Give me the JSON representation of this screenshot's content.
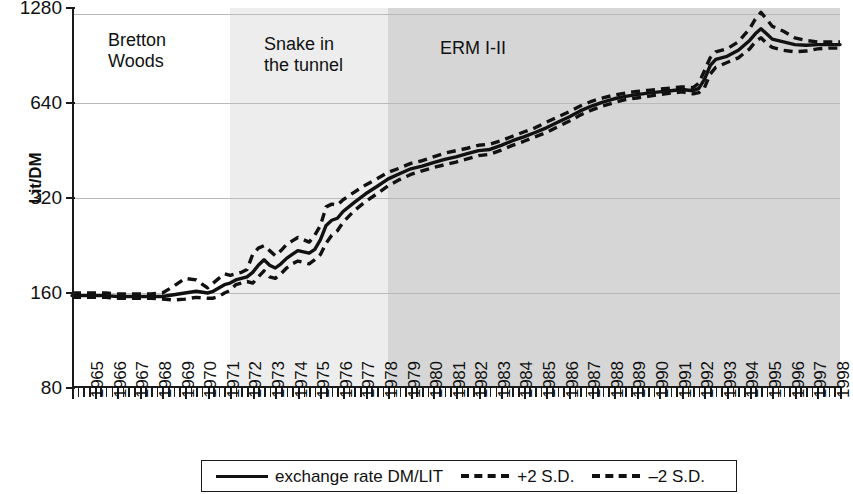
{
  "chart_data": {
    "type": "line",
    "title": "",
    "xlabel": "",
    "ylabel": "Lit/DM",
    "y_scale": "log2",
    "ylim": [
      80,
      1280
    ],
    "ytick_labels": [
      "1280",
      "640",
      "320",
      "160",
      "80"
    ],
    "ytick_values": [
      1280,
      640,
      320,
      160,
      80
    ],
    "xlim": [
      1965,
      1999
    ],
    "grid": true,
    "legend_position": "bottom",
    "categories": [
      "1965",
      "1966",
      "1967",
      "1968",
      "1969",
      "1970",
      "1971",
      "1972",
      "1973",
      "1974",
      "1975",
      "1976",
      "1977",
      "1978",
      "1979",
      "1980",
      "1981",
      "1982",
      "1983",
      "1984",
      "1985",
      "1986",
      "1987",
      "1988",
      "1989",
      "1990",
      "1991",
      "1992",
      "1993",
      "1994",
      "1995",
      "1996",
      "1997",
      "1998"
    ],
    "regions": [
      {
        "label": "Bretton\nWoods",
        "label_line1": "Bretton",
        "label_line2": "Woods",
        "start": 1965,
        "end": 1972.0,
        "color": "#ffffff"
      },
      {
        "label": "Snake in\nthe tunnel",
        "label_line1": "Snake in",
        "label_line2": "the tunnel",
        "start": 1972.0,
        "end": 1979.0,
        "color": "#ededed"
      },
      {
        "label": "ERM I-II",
        "label_line1": "ERM I-II",
        "label_line2": "",
        "start": 1979.0,
        "end": 1999.0,
        "color": "#d6d6d6"
      }
    ],
    "series": [
      {
        "name": "exchange rate DM/LIT",
        "style": "solid",
        "color": "#111111",
        "x": [
          1965.0,
          1965.5,
          1966.0,
          1966.5,
          1967.0,
          1967.5,
          1968.0,
          1968.5,
          1969.0,
          1969.5,
          1970.0,
          1970.5,
          1971.0,
          1971.25,
          1971.5,
          1971.75,
          1972.0,
          1972.25,
          1972.5,
          1972.75,
          1973.0,
          1973.25,
          1973.5,
          1973.75,
          1974.0,
          1974.25,
          1974.5,
          1974.75,
          1975.0,
          1975.25,
          1975.5,
          1975.75,
          1976.0,
          1976.25,
          1976.5,
          1976.75,
          1977.0,
          1977.5,
          1978.0,
          1978.5,
          1979.0,
          1979.5,
          1980.0,
          1980.5,
          1981.0,
          1981.5,
          1982.0,
          1982.5,
          1983.0,
          1983.5,
          1984.0,
          1984.5,
          1985.0,
          1985.5,
          1986.0,
          1986.5,
          1987.0,
          1987.5,
          1988.0,
          1988.5,
          1989.0,
          1989.5,
          1990.0,
          1990.5,
          1991.0,
          1991.5,
          1992.0,
          1992.5,
          1992.75,
          1993.0,
          1993.25,
          1993.5,
          1994.0,
          1994.5,
          1995.0,
          1995.25,
          1995.5,
          1995.75,
          1996.0,
          1996.5,
          1997.0,
          1997.5,
          1998.0,
          1998.5,
          1999.0
        ],
        "y": [
          157,
          157,
          157,
          157,
          156,
          156,
          156,
          156,
          156,
          158,
          160,
          162,
          160,
          162,
          166,
          170,
          172,
          176,
          178,
          180,
          186,
          196,
          204,
          196,
          192,
          198,
          206,
          212,
          218,
          216,
          214,
          220,
          236,
          262,
          272,
          276,
          290,
          310,
          330,
          348,
          368,
          382,
          396,
          404,
          414,
          424,
          432,
          442,
          452,
          456,
          470,
          486,
          500,
          516,
          534,
          556,
          578,
          604,
          626,
          644,
          660,
          672,
          680,
          688,
          694,
          700,
          706,
          700,
          712,
          760,
          840,
          880,
          900,
          940,
          1010,
          1060,
          1100,
          1060,
          1020,
          1000,
          980,
          975,
          980,
          980,
          980
        ]
      },
      {
        "name": "+2 S.D.",
        "style": "dashed",
        "color": "#111111",
        "x": [
          1965.0,
          1965.5,
          1966.0,
          1966.5,
          1967.0,
          1967.5,
          1968.0,
          1968.5,
          1969.0,
          1969.5,
          1970.0,
          1970.5,
          1971.0,
          1971.25,
          1971.5,
          1971.75,
          1972.0,
          1972.25,
          1972.5,
          1972.75,
          1973.0,
          1973.25,
          1973.5,
          1973.75,
          1974.0,
          1974.25,
          1974.5,
          1974.75,
          1975.0,
          1975.25,
          1975.5,
          1975.75,
          1976.0,
          1976.25,
          1976.5,
          1976.75,
          1977.0,
          1977.5,
          1978.0,
          1978.5,
          1979.0,
          1979.5,
          1980.0,
          1980.5,
          1981.0,
          1981.5,
          1982.0,
          1982.5,
          1983.0,
          1983.5,
          1984.0,
          1984.5,
          1985.0,
          1985.5,
          1986.0,
          1986.5,
          1987.0,
          1987.5,
          1988.0,
          1988.5,
          1989.0,
          1989.5,
          1990.0,
          1990.5,
          1991.0,
          1991.5,
          1992.0,
          1992.5,
          1992.75,
          1993.0,
          1993.25,
          1993.5,
          1994.0,
          1994.5,
          1995.0,
          1995.25,
          1995.5,
          1995.75,
          1996.0,
          1996.5,
          1997.0,
          1997.5,
          1998.0,
          1998.5,
          1999.0
        ],
        "y": [
          160,
          160,
          160,
          160,
          159,
          159,
          159,
          159,
          160,
          168,
          178,
          176,
          166,
          172,
          178,
          184,
          182,
          184,
          186,
          190,
          212,
          222,
          226,
          218,
          210,
          218,
          228,
          234,
          240,
          236,
          232,
          244,
          262,
          300,
          306,
          304,
          316,
          334,
          352,
          368,
          386,
          398,
          412,
          420,
          432,
          444,
          452,
          460,
          470,
          474,
          486,
          502,
          518,
          534,
          556,
          578,
          600,
          626,
          648,
          664,
          678,
          688,
          696,
          702,
          708,
          714,
          720,
          716,
          740,
          810,
          890,
          930,
          950,
          1000,
          1100,
          1180,
          1240,
          1180,
          1120,
          1080,
          1030,
          1010,
          1000,
          1000,
          1000
        ]
      },
      {
        "name": "-2 S.D.",
        "style": "dashed",
        "color": "#111111",
        "x": [
          1965.0,
          1965.5,
          1966.0,
          1966.5,
          1967.0,
          1967.5,
          1968.0,
          1968.5,
          1969.0,
          1969.5,
          1970.0,
          1970.5,
          1971.0,
          1971.25,
          1971.5,
          1971.75,
          1972.0,
          1972.25,
          1972.5,
          1972.75,
          1973.0,
          1973.25,
          1973.5,
          1973.75,
          1974.0,
          1974.25,
          1974.5,
          1974.75,
          1975.0,
          1975.25,
          1975.5,
          1975.75,
          1976.0,
          1976.25,
          1976.5,
          1976.75,
          1977.0,
          1977.5,
          1978.0,
          1978.5,
          1979.0,
          1979.5,
          1980.0,
          1980.5,
          1981.0,
          1981.5,
          1982.0,
          1982.5,
          1983.0,
          1983.5,
          1984.0,
          1984.5,
          1985.0,
          1985.5,
          1986.0,
          1986.5,
          1987.0,
          1987.5,
          1988.0,
          1988.5,
          1989.0,
          1989.5,
          1990.0,
          1990.5,
          1991.0,
          1991.5,
          1992.0,
          1992.5,
          1992.75,
          1993.0,
          1993.25,
          1993.5,
          1994.0,
          1994.5,
          1995.0,
          1995.25,
          1995.5,
          1995.75,
          1996.0,
          1996.5,
          1997.0,
          1997.5,
          1998.0,
          1998.5,
          1999.0
        ],
        "y": [
          155,
          155,
          155,
          155,
          154,
          154,
          154,
          154,
          153,
          152,
          153,
          155,
          154,
          154,
          156,
          160,
          163,
          170,
          172,
          174,
          172,
          180,
          188,
          180,
          178,
          184,
          192,
          198,
          202,
          200,
          198,
          204,
          212,
          230,
          244,
          252,
          268,
          292,
          312,
          330,
          350,
          366,
          380,
          390,
          400,
          408,
          416,
          426,
          436,
          440,
          454,
          470,
          484,
          500,
          516,
          538,
          560,
          586,
          608,
          626,
          642,
          656,
          664,
          672,
          680,
          688,
          694,
          684,
          690,
          716,
          790,
          830,
          860,
          890,
          950,
          1000,
          1030,
          990,
          960,
          940,
          930,
          935,
          950,
          955,
          955
        ]
      }
    ]
  },
  "legend": {
    "items": [
      {
        "label": "exchange rate DM/LIT",
        "style": "solid"
      },
      {
        "label": "+2 S.D.",
        "style": "dashed"
      },
      {
        "label": "–2 S.D.",
        "style": "dashed"
      }
    ]
  }
}
